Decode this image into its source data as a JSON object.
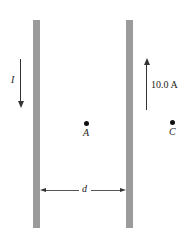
{
  "diagram": {
    "wires": [
      {
        "id": "left",
        "label": "",
        "current_direction": "down"
      },
      {
        "id": "right",
        "label": "",
        "current_direction": "up"
      }
    ],
    "current_left": {
      "label": "I",
      "direction": "down"
    },
    "current_right": {
      "label": "10.0 A",
      "direction": "up"
    },
    "points": [
      {
        "label": "A",
        "position": "between wires"
      },
      {
        "label": "C",
        "position": "right of right wire"
      }
    ],
    "separation": {
      "label": "d"
    },
    "colors": {
      "wire": "#9b9b9b",
      "ink": "#333333"
    }
  }
}
